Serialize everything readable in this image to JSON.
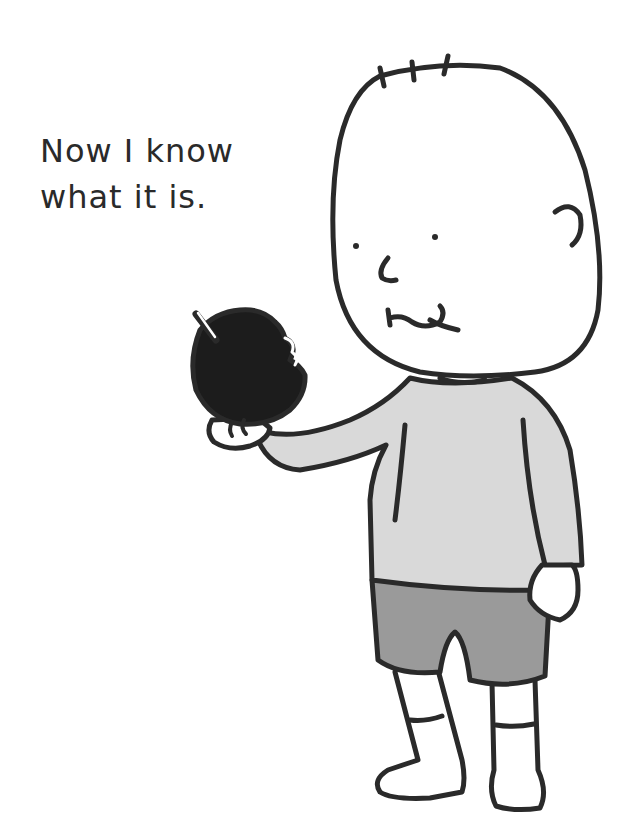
{
  "caption": {
    "line1": "Now I know",
    "line2": "what it is."
  },
  "illustration": {
    "subject": "bald child holding a bitten black apple",
    "colors": {
      "outline": "#2a2a2a",
      "shirt": "#d9d9d9",
      "shorts": "#9a9a9a",
      "apple": "#1c1c1c",
      "skin": "#ffffff"
    }
  }
}
